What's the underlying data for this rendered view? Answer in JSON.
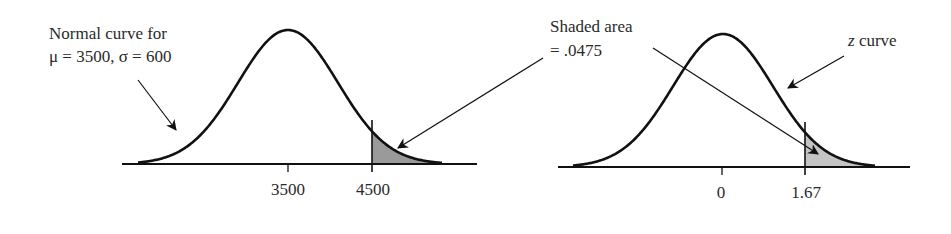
{
  "chart_data": [
    {
      "type": "area",
      "title": "",
      "annotation": [
        "Normal curve for",
        "μ = 3500, σ = 600"
      ],
      "distribution": {
        "mean": 3500,
        "sd": 600
      },
      "x_ticks": [
        "3500",
        "4500"
      ],
      "shaded_region": {
        "from": 4500,
        "to": "∞",
        "area": ".0475"
      },
      "xlabel": "",
      "ylabel": "",
      "grid": false
    },
    {
      "type": "area",
      "title": "",
      "annotation": [
        "z curve"
      ],
      "distribution": {
        "mean": 0,
        "sd": 1
      },
      "x_ticks": [
        "0",
        "1.67"
      ],
      "shaded_region": {
        "from": 1.67,
        "to": "∞",
        "area": ".0475"
      },
      "xlabel": "",
      "ylabel": "",
      "grid": false
    }
  ],
  "labels": {
    "left_line1": "Normal curve for",
    "left_line2": "μ = 3500, σ = 600",
    "shaded_line1": "Shaded area",
    "shaded_line2": "= .0475",
    "z_italic": "z",
    "z_rest": " curve"
  },
  "ticks": {
    "left": [
      "3500",
      "4500"
    ],
    "right": [
      "0",
      "1.67"
    ]
  },
  "colors": {
    "shade": "#9a9a9a",
    "shade_right": "#c4c4c4",
    "line": "#111111"
  }
}
